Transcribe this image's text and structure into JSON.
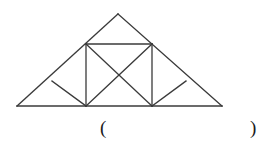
{
  "figure": {
    "name": "isosceles-triangle-with-inscribed-square",
    "stroke_color": "#3a3a3a",
    "stroke_width": 1.3,
    "background_color": "#ffffff",
    "canvas": {
      "width": 265,
      "height": 142
    },
    "points": {
      "apex": [
        118,
        14
      ],
      "base_left": [
        17,
        106
      ],
      "base_right": [
        222,
        106
      ],
      "square_top_left": [
        86,
        44
      ],
      "square_top_right": [
        152,
        44
      ],
      "square_bottom_left": [
        86,
        106
      ],
      "square_bottom_right": [
        152,
        106
      ],
      "left_slope_node": [
        52,
        81
      ],
      "right_slope_node": [
        186,
        81
      ]
    },
    "segments": [
      {
        "name": "triangle-left-side",
        "from": "base_left",
        "to": "apex"
      },
      {
        "name": "triangle-right-side",
        "from": "apex",
        "to": "base_right"
      },
      {
        "name": "triangle-base",
        "from": "base_left",
        "to": "base_right"
      },
      {
        "name": "square-top-edge",
        "from": "square_top_left",
        "to": "square_top_right"
      },
      {
        "name": "square-left-edge",
        "from": "square_top_left",
        "to": "square_bottom_left"
      },
      {
        "name": "square-right-edge",
        "from": "square_top_right",
        "to": "square_bottom_right"
      },
      {
        "name": "square-diagonal-falling",
        "from": "square_top_left",
        "to": "square_bottom_right"
      },
      {
        "name": "square-diagonal-rising",
        "from": "square_top_right",
        "to": "square_bottom_left"
      },
      {
        "name": "left-small-triangle-chord",
        "from": "left_slope_node",
        "to": "square_bottom_left"
      },
      {
        "name": "right-small-triangle-chord",
        "from": "square_bottom_right",
        "to": "right_slope_node"
      }
    ]
  },
  "answer": {
    "open_paren": "(",
    "close_paren": ")"
  }
}
